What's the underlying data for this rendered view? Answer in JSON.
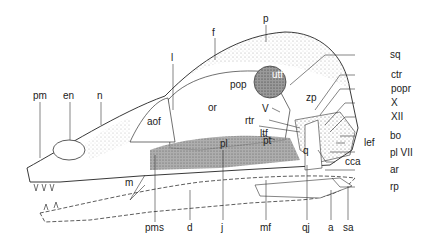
{
  "figure": {
    "labels": {
      "pm": "pm",
      "en": "en",
      "n": "n",
      "l": "l",
      "f": "f",
      "p": "p",
      "aof": "aof",
      "or": "or",
      "utf": "utf",
      "pop": "pop",
      "zp": "zp",
      "sq": "sq",
      "ctr": "ctr",
      "popr": "popr",
      "X": "X",
      "XII": "XII",
      "V": "V",
      "rtr": "rtr",
      "ltf": "ltf",
      "pl": "pl",
      "pt": "pt",
      "q": "q",
      "bo": "bo",
      "lef": "lef",
      "plVII": "pl VII",
      "cca": "cca",
      "ar": "ar",
      "rp": "rp",
      "m": "m",
      "pms": "pms",
      "d": "d",
      "j": "j",
      "mf": "mf",
      "qj": "qj",
      "a": "a",
      "sa": "sa"
    }
  }
}
